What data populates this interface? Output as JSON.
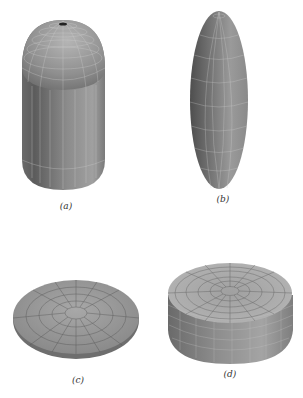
{
  "figure": {
    "panels": [
      {
        "id": "a",
        "label": "(a)",
        "shape": "prolate-capsule",
        "description": "Cylinder with hemispherical top cap and rounded bottom (elongated capsule), wireframe mesh"
      },
      {
        "id": "b",
        "label": "(b)",
        "shape": "prolate-ellipsoid",
        "description": "Elongated ellipsoid, wireframe mesh"
      },
      {
        "id": "c",
        "label": "(c)",
        "shape": "oblate-spheroid",
        "description": "Flattened disc-like spheroid, wireframe mesh"
      },
      {
        "id": "d",
        "label": "(d)",
        "shape": "oblate-cylinder",
        "description": "Short wide cylinder with flat top and rounded bottom edge, wireframe mesh"
      }
    ],
    "colors": {
      "background": "#ffffff",
      "surface_dark": "#5a5a5a",
      "surface_mid": "#8a8a8a",
      "surface_light": "#b8b8b8",
      "mesh_line": "#d8d8d8",
      "label": "#333333"
    }
  }
}
